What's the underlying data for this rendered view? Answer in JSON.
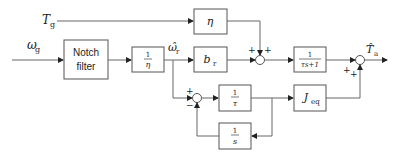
{
  "inputs": {
    "torque": {
      "symbol": "T",
      "sub": "g"
    },
    "speed": {
      "symbol": "ω",
      "sub": "g"
    }
  },
  "blocks": {
    "notch": {
      "line1": "Notch",
      "line2": "filter"
    },
    "inv_eta": {
      "num": "1",
      "den": "η"
    },
    "eta": {
      "label": "η"
    },
    "b_r": {
      "symbol": "b",
      "sub": "r"
    },
    "lowpass": {
      "num": "1",
      "den": "τs+1"
    },
    "inv_tau": {
      "num": "1",
      "den": "τ"
    },
    "integrator": {
      "num": "1",
      "den": "s"
    },
    "j_eq": {
      "symbol": "J",
      "sub": "eq"
    }
  },
  "signals": {
    "omega_r_hat": {
      "symbol": "ω̂",
      "sub": "r"
    },
    "output": {
      "symbol": "T̂",
      "sub": "a"
    }
  },
  "sum_signs": {
    "sum1_left": "+",
    "sum1_top": "+",
    "sum2_left": "+",
    "sum2_bottom": "+",
    "sum3_top": "+",
    "sum3_bottom": "−"
  },
  "colors": {
    "line": "#666666",
    "box_border": "#555555",
    "background": "#ffffff"
  }
}
